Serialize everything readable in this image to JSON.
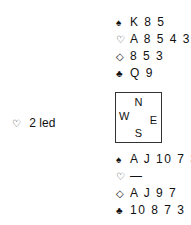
{
  "north": {
    "spades": "K 8 5",
    "hearts": "A 8 5 4 3",
    "diamonds": "8 5 3",
    "clubs": "Q 9"
  },
  "south": {
    "spades": "A J 10 7 3",
    "hearts": "—",
    "diamonds": "A J 9 7",
    "clubs": "10 8 7 3"
  },
  "compass": {
    "n": "N",
    "s": "S",
    "w": "W",
    "e": "E"
  },
  "lead": {
    "suit_symbol": "♡",
    "text": "2 led"
  },
  "symbols": {
    "spade": "♠",
    "heart": "♡",
    "diamond": "◇",
    "club": "♣"
  }
}
